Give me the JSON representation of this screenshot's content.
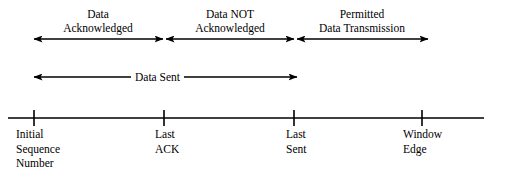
{
  "figure": {
    "type": "diagram",
    "background_color": "#ffffff",
    "line_color": "#000000"
  },
  "segments": [
    {
      "id": "data-acknowledged",
      "line1": "Data",
      "line2": "Acknowledged",
      "from_marker": "initial-sequence-number",
      "to_marker": "last-ack",
      "x_start": 34,
      "x_end": 163,
      "arrow_y": 39,
      "center_x": 98
    },
    {
      "id": "data-not-acknowledged",
      "line1": "Data NOT",
      "line2": "Acknowledged",
      "from_marker": "last-ack",
      "to_marker": "last-sent",
      "x_start": 166,
      "x_end": 294,
      "arrow_y": 39,
      "center_x": 230
    },
    {
      "id": "permitted-data-transmission",
      "line1": "Permitted",
      "line2": "Data Transmission",
      "from_marker": "last-sent",
      "to_marker": "window-edge",
      "x_start": 297,
      "x_end": 428,
      "arrow_y": 39,
      "center_x": 362
    }
  ],
  "span": {
    "id": "data-sent",
    "label": "Data Sent",
    "from_marker": "initial-sequence-number",
    "to_marker": "last-sent",
    "x_start": 34,
    "x_end": 297,
    "arrow_y": 77,
    "label_center_x": 165
  },
  "axis": {
    "id": "sequence-number-axis",
    "y": 118,
    "x_start": 8,
    "x_end": 484,
    "tick_half_height": 8
  },
  "markers": [
    {
      "id": "initial-sequence-number",
      "x": 34,
      "lines": [
        "Initial",
        "Sequence",
        "Number"
      ],
      "label_x": 16
    },
    {
      "id": "last-ack",
      "x": 164,
      "lines": [
        "Last",
        "ACK"
      ],
      "label_x": 155
    },
    {
      "id": "last-sent",
      "x": 294,
      "lines": [
        "Last",
        "Sent"
      ],
      "label_x": 286
    },
    {
      "id": "window-edge",
      "x": 422,
      "lines": [
        "Window",
        "Edge"
      ],
      "label_x": 403
    }
  ]
}
